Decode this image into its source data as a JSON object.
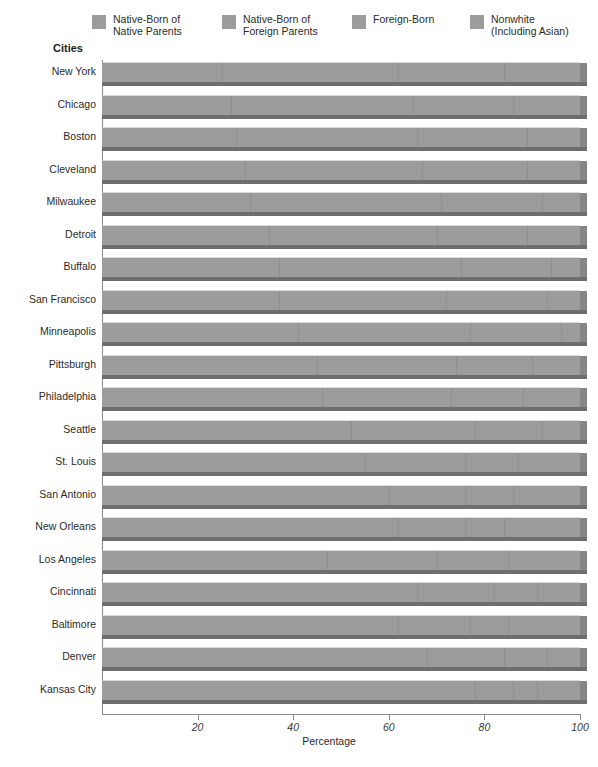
{
  "legend": {
    "items": [
      {
        "label": "Native-Born of\nNative Parents",
        "color": "#9c9c9c",
        "name": "legend-native-born-native-parents"
      },
      {
        "label": "Native-Born of\nForeign Parents",
        "color": "#9c9c9c",
        "name": "legend-native-born-foreign-parents"
      },
      {
        "label": "Foreign-Born",
        "color": "#9c9c9c",
        "name": "legend-foreign-born"
      },
      {
        "label": "Nonwhite\n(Including Asian)",
        "color": "#9c9c9c",
        "name": "legend-nonwhite-including-asian"
      }
    ]
  },
  "axes": {
    "y_title": "Cities",
    "x_title": "Percentage",
    "x_ticks": [
      20,
      40,
      60,
      80,
      100
    ],
    "x_tick_labels": [
      "20",
      "40",
      "60",
      "80",
      "100"
    ]
  },
  "colors": {
    "bar_fill": "#9c9c9c",
    "bar_shadow": "#6e6e6e",
    "bar_cap": "#868686",
    "axis": "#8b8b8b",
    "text": "#2b2b2b"
  },
  "chart_data": {
    "type": "bar",
    "title": "",
    "subtitle": "",
    "orientation": "horizontal",
    "stacked": true,
    "stack_total": 100,
    "xlabel": "Percentage",
    "ylabel": "Cities",
    "xlim": [
      0,
      100
    ],
    "grid": false,
    "legend_position": "top",
    "categories": [
      "New York",
      "Chicago",
      "Boston",
      "Cleveland",
      "Milwaukee",
      "Detroit",
      "Buffalo",
      "San Francisco",
      "Minneapolis",
      "Pittsburgh",
      "Philadelphia",
      "Seattle",
      "St. Louis",
      "San Antonio",
      "New Orleans",
      "Los Angeles",
      "Cincinnati",
      "Baltimore",
      "Denver",
      "Kansas City"
    ],
    "series": [
      {
        "name": "Native-Born of Native Parents",
        "values": [
          25,
          27,
          28,
          30,
          31,
          35,
          37,
          37,
          41,
          45,
          46,
          52,
          55,
          60,
          62,
          47,
          66,
          62,
          68,
          78
        ]
      },
      {
        "name": "Native-Born of Foreign Parents",
        "values": [
          37,
          38,
          38,
          37,
          40,
          35,
          38,
          35,
          36,
          29,
          27,
          26,
          21,
          16,
          14,
          23,
          16,
          15,
          16,
          8
        ]
      },
      {
        "name": "Foreign-Born",
        "values": [
          22,
          21,
          23,
          22,
          21,
          19,
          19,
          21,
          19,
          16,
          15,
          14,
          11,
          10,
          8,
          15,
          9,
          8,
          9,
          5
        ]
      },
      {
        "name": "Nonwhite (Including Asian)",
        "values": [
          16,
          14,
          11,
          11,
          8,
          11,
          6,
          7,
          4,
          10,
          12,
          8,
          13,
          14,
          16,
          15,
          9,
          15,
          7,
          9
        ]
      }
    ]
  }
}
